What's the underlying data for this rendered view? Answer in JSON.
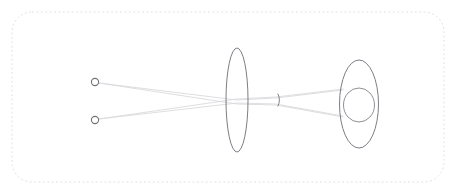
{
  "figure": {
    "width": 456,
    "height": 194,
    "background_color": "#ffffff",
    "border": {
      "style": "dashed",
      "color": "#e2e2e6",
      "corner_radius": 20,
      "x": 12,
      "y": 12,
      "width": 432,
      "height": 170
    }
  },
  "colors": {
    "optic_stroke": "#6e6e76",
    "ray_stroke": "#d8d8dc",
    "point_stroke": "#71717a",
    "border_stroke": "#e2e2e6",
    "background": "#ffffff"
  },
  "elements": {
    "object_points": [
      {
        "name": "object-point-upper",
        "cx": 95,
        "cy": 82,
        "r": 3.6
      },
      {
        "name": "object-point-lower",
        "cx": 95,
        "cy": 120,
        "r": 3.6
      }
    ],
    "lens": {
      "name": "converging-lens",
      "cx": 237,
      "cy": 100,
      "rx": 11,
      "ry": 52
    },
    "aperture": {
      "name": "aperture-stop",
      "cx": 278,
      "cy": 100,
      "rx": 3,
      "ry": 6,
      "arc_side": "right"
    },
    "eye_outer": {
      "name": "eye-outer-ellipse",
      "cx": 359,
      "cy": 104,
      "rx": 19.5,
      "ry": 44
    },
    "eye_inner": {
      "name": "eye-inner-ellipse",
      "cx": 359,
      "cy": 105,
      "rx": 15.5,
      "ry": 17
    }
  },
  "rays": [
    {
      "name": "ray-upper-to-lower-image",
      "points": [
        [
          99,
          83
        ],
        [
          237,
          104
        ],
        [
          276,
          105
        ],
        [
          343,
          117
        ]
      ]
    },
    {
      "name": "ray-upper-to-upper-image",
      "points": [
        [
          99,
          83
        ],
        [
          237,
          100
        ],
        [
          276,
          98
        ],
        [
          343,
          90
        ]
      ]
    },
    {
      "name": "ray-lower-to-upper-image",
      "points": [
        [
          99,
          119
        ],
        [
          237,
          99
        ],
        [
          276,
          97
        ],
        [
          343,
          89
        ]
      ]
    },
    {
      "name": "ray-lower-to-lower-image",
      "points": [
        [
          99,
          119
        ],
        [
          237,
          103
        ],
        [
          276,
          104
        ],
        [
          343,
          116
        ]
      ]
    }
  ],
  "chart_data": {
    "type": "diagram",
    "axis_y": 100,
    "components": [
      {
        "label": "object point 1",
        "x": 95,
        "y": 82
      },
      {
        "label": "object point 2",
        "x": 95,
        "y": 120
      },
      {
        "label": "converging lens",
        "x": 237,
        "y": 100
      },
      {
        "label": "aperture stop",
        "x": 278,
        "y": 100
      },
      {
        "label": "eye",
        "x": 359,
        "y": 104
      }
    ]
  }
}
